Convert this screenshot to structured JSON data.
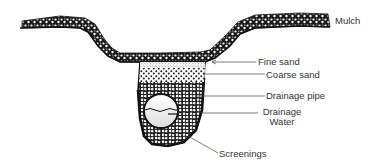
{
  "diagram": {
    "type": "cross-section",
    "labels": {
      "mulch": "Mulch",
      "fine_sand": "Fine sand",
      "coarse_sand": "Coarse sand",
      "drainage_pipe": "Drainage pipe",
      "drainage_water_line1": "Drainage",
      "drainage_water_line2": "Water",
      "screenings": "Screenings"
    },
    "colors": {
      "ink": "#111111",
      "label_text": "#333333",
      "leader_line": "#444444",
      "background": "#ffffff"
    }
  }
}
